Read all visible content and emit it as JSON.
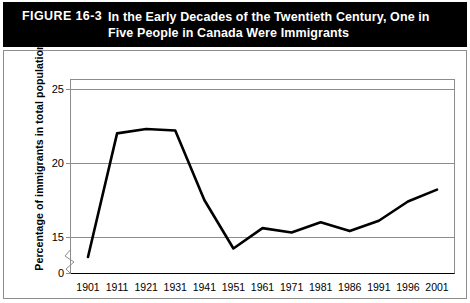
{
  "header": {
    "figure_number": "FIGURE 16-3",
    "title": "In the Early Decades of the Twentieth Century, One in Five People in Canada Were Immigrants"
  },
  "colors": {
    "header_background": "#000000",
    "header_text": "#ffffff",
    "line": "#000000",
    "gridline": "#8d8d8d",
    "plot_background": "#ffffff"
  },
  "chart_data": {
    "type": "line",
    "title": "In the Early Decades of the Twentieth Century, One in Five People in Canada Were Immigrants",
    "xlabel": "",
    "ylabel": "Percentage of immigrants in total population",
    "categories": [
      "1901",
      "1911",
      "1921",
      "1931",
      "1941",
      "1951",
      "1961",
      "1971",
      "1981",
      "1986",
      "1991",
      "1996",
      "2001"
    ],
    "values": [
      13.0,
      22.0,
      22.3,
      22.2,
      17.5,
      14.7,
      15.6,
      15.3,
      16.0,
      15.4,
      16.1,
      17.4,
      18.2
    ],
    "yticks": [
      "0",
      "15",
      "20",
      "25"
    ],
    "ytick_values": [
      0,
      15,
      20,
      25
    ],
    "ylim": [
      13.5,
      25.6
    ],
    "grid": true,
    "legend": "none",
    "axis_break": true,
    "axis_break_note": "y-axis broken between 0 and 15"
  }
}
